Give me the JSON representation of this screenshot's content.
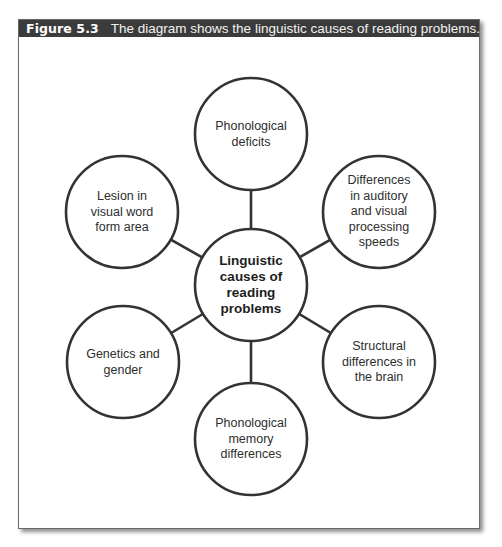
{
  "figure": {
    "label": "Figure 5.3",
    "caption": "The diagram shows the linguistic causes of reading problems."
  },
  "colors": {
    "header_bg": "#3b3b3b",
    "header_text": "#ffffff",
    "stroke": "#333333",
    "text": "#2e2e2e"
  },
  "diagram": {
    "center": {
      "id": "center",
      "lines": [
        "Linguistic",
        "causes of",
        "reading",
        "problems"
      ],
      "cx": 251,
      "cy": 285,
      "r": 56
    },
    "nodes": [
      {
        "id": "top",
        "lines": [
          "Phonological",
          "deficits"
        ],
        "cx": 251,
        "cy": 134,
        "r": 56
      },
      {
        "id": "upper-right",
        "lines": [
          "Differences",
          "in auditory",
          "and visual",
          "processing",
          "speeds"
        ],
        "cx": 379,
        "cy": 212,
        "r": 56
      },
      {
        "id": "lower-right",
        "lines": [
          "Structural",
          "differences in",
          "the brain"
        ],
        "cx": 379,
        "cy": 362,
        "r": 56
      },
      {
        "id": "bottom",
        "lines": [
          "Phonological",
          "memory",
          "differences"
        ],
        "cx": 251,
        "cy": 439,
        "r": 56
      },
      {
        "id": "lower-left",
        "lines": [
          "Genetics and",
          "gender"
        ],
        "cx": 123,
        "cy": 362,
        "r": 56
      },
      {
        "id": "upper-left",
        "lines": [
          "Lesion in",
          "visual word",
          "form area"
        ],
        "cx": 122,
        "cy": 212,
        "r": 56
      }
    ]
  }
}
